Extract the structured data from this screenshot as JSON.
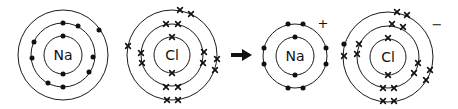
{
  "atoms": [
    {
      "id": "na-atom",
      "symbol": "Na",
      "charge": "",
      "shells": [
        2,
        8,
        1
      ],
      "electron_marker": "dot"
    },
    {
      "id": "cl-atom",
      "symbol": "Cl",
      "charge": "",
      "shells": [
        2,
        8,
        7
      ],
      "electron_marker": "cross"
    },
    {
      "id": "na-ion",
      "symbol": "Na",
      "charge": "+",
      "shells": [
        2,
        8
      ],
      "electron_marker": "dot"
    },
    {
      "id": "cl-ion",
      "symbol": "Cl",
      "charge": "−",
      "shells": [
        2,
        8,
        8
      ],
      "electron_marker": "cross",
      "transferred_electron": "dot"
    }
  ],
  "arrow": {
    "direction": "right",
    "meaning": "reaction"
  },
  "colors": {
    "ink": "#111111",
    "background": "#ffffff"
  }
}
